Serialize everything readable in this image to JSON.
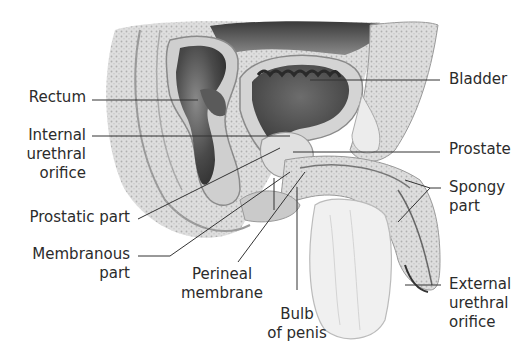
{
  "figure": {
    "type": "anatomical-illustration"
  },
  "labels": {
    "rectum": "Rectum",
    "internal_orifice": [
      "Internal",
      "urethral",
      "orifice"
    ],
    "prostatic_part": "Prostatic part",
    "membranous_part": [
      "Membranous",
      "part"
    ],
    "perineal_membrane": [
      "Perineal",
      "membrane"
    ],
    "bulb_of_penis": [
      "Bulb",
      "of penis"
    ],
    "bladder": "Bladder",
    "prostate": "Prostate",
    "spongy_part": [
      "Spongy",
      "part"
    ],
    "external_orifice": [
      "External",
      "urethral",
      "orifice"
    ]
  },
  "colors": {
    "tissue_light": "#d9d9d9",
    "tissue_mid": "#b5b5b5",
    "tissue_dark": "#5a5a5a",
    "cavity": "#3c3c3c",
    "leader_line": "#333333"
  }
}
